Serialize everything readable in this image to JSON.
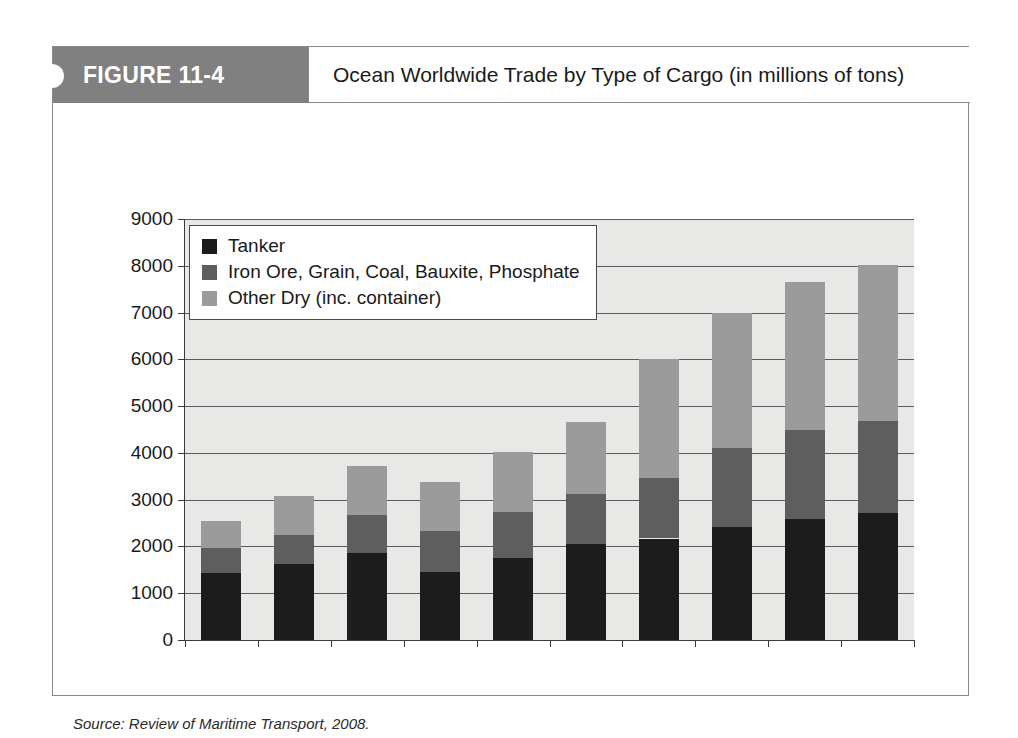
{
  "figure": {
    "number_label": "FIGURE 11-4",
    "title": "Ocean Worldwide Trade by Type of Cargo (in millions of tons)",
    "source": "Source: Review of Maritime Transport, 2008."
  },
  "colors": {
    "banner": "#808080",
    "plot_background": "#e8e8e6",
    "tanker": "#1c1c1c",
    "iron_ore": "#5e5e5e",
    "other_dry": "#9b9b9b"
  },
  "chart_data": {
    "type": "bar",
    "stacked": true,
    "title": "Ocean Worldwide Trade by Type of Cargo (in millions of tons)",
    "xlabel": "",
    "ylabel": "",
    "ylim": [
      0,
      9000
    ],
    "yticks": [
      0,
      1000,
      2000,
      3000,
      4000,
      5000,
      6000,
      7000,
      8000,
      9000
    ],
    "ytick_labels": [
      "0",
      "1000",
      "2000",
      "3000",
      "4000",
      "5000",
      "6000",
      "7000",
      "8000",
      "9000"
    ],
    "grid": true,
    "legend_position": "upper left",
    "categories": [
      "1970",
      "1975",
      "1980",
      "1985",
      "1990",
      "1995",
      "2000",
      "2005",
      "2006",
      "2007"
    ],
    "series": [
      {
        "name": "Tanker",
        "color": "#1c1c1c",
        "values": [
          1440,
          1630,
          1870,
          1450,
          1755,
          2050,
          2170,
          2420,
          2590,
          2720
        ]
      },
      {
        "name": "Iron Ore, Grain, Coal, Bauxite, Phosphate",
        "color": "#5e5e5e",
        "values": [
          525,
          620,
          800,
          880,
          975,
          1080,
          1290,
          1680,
          1890,
          1970
        ]
      },
      {
        "name": "Other Dry (inc. container)",
        "color": "#9b9b9b",
        "values": [
          585,
          830,
          1050,
          1050,
          1280,
          1520,
          2540,
          2900,
          3170,
          3330
        ]
      }
    ],
    "totals": [
      2550,
      3080,
      3720,
      3380,
      4010,
      4650,
      6000,
      7000,
      7650,
      8020
    ]
  }
}
